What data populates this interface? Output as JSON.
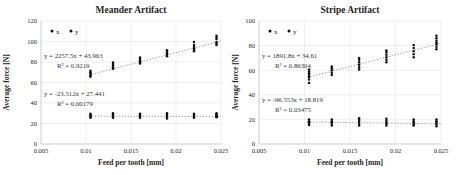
{
  "page": {
    "background": "#ffffff",
    "text_color": "#262626",
    "gridline_color": "#e3e3e3",
    "axis_color": "#bfbfbf",
    "point_color": "#111111",
    "trendline_color": "#6e6e6e"
  },
  "chart_data": [
    {
      "type": "scatter",
      "title": "Meander Artifact",
      "xlabel": "Feed per tooth [mm]",
      "ylabel": "Average force [N]",
      "xlim": [
        0.005,
        0.025
      ],
      "ylim": [
        0,
        120
      ],
      "xticks": [
        "0.005",
        "0.01",
        "0.015",
        "0.02",
        "0.025"
      ],
      "yticks": [
        0,
        20,
        40,
        60,
        80,
        100,
        120
      ],
      "grid": true,
      "legend_position": "top-left-inset",
      "legend": [
        "x",
        "y"
      ],
      "annotations": [
        {
          "equation": "y = 2257.5x + 43.963",
          "r_squared": "R² = 0.9219"
        },
        {
          "equation": "y = -23.512x + 27.441",
          "r_squared": "R² = 0.00179"
        }
      ],
      "trendlines": [
        {
          "slope": 2257.5,
          "intercept": 43.963,
          "x_range": [
            0.0103,
            0.025
          ]
        },
        {
          "slope": -23.512,
          "intercept": 27.441,
          "x_range": [
            0.0103,
            0.025
          ]
        }
      ],
      "series": [
        {
          "name": "x",
          "points": [
            [
              0.0105,
              65.5
            ],
            [
              0.0105,
              67
            ],
            [
              0.0105,
              68.5
            ],
            [
              0.0105,
              70
            ],
            [
              0.0105,
              71.5
            ],
            [
              0.013,
              73.5
            ],
            [
              0.013,
              75
            ],
            [
              0.013,
              76.5
            ],
            [
              0.013,
              78
            ],
            [
              0.013,
              79.5
            ],
            [
              0.016,
              78.5
            ],
            [
              0.016,
              80
            ],
            [
              0.016,
              81.5
            ],
            [
              0.016,
              83
            ],
            [
              0.016,
              84.5
            ],
            [
              0.019,
              85.5
            ],
            [
              0.019,
              87
            ],
            [
              0.019,
              88.5
            ],
            [
              0.019,
              90
            ],
            [
              0.019,
              91.5
            ],
            [
              0.022,
              90.5
            ],
            [
              0.022,
              92
            ],
            [
              0.022,
              93.5
            ],
            [
              0.022,
              95
            ],
            [
              0.022,
              96.5
            ],
            [
              0.022,
              99.5
            ],
            [
              0.0245,
              96.5
            ],
            [
              0.0245,
              98
            ],
            [
              0.0245,
              99.5
            ],
            [
              0.0245,
              102.5
            ],
            [
              0.0245,
              104
            ],
            [
              0.0245,
              105.5
            ]
          ]
        },
        {
          "name": "y",
          "points": [
            [
              0.0105,
              25.5
            ],
            [
              0.0105,
              26.5
            ],
            [
              0.0105,
              27.5
            ],
            [
              0.0105,
              28.5
            ],
            [
              0.0105,
              29.5
            ],
            [
              0.013,
              25.5
            ],
            [
              0.013,
              26.5
            ],
            [
              0.013,
              27.5
            ],
            [
              0.013,
              28.5
            ],
            [
              0.013,
              30
            ],
            [
              0.016,
              25.5
            ],
            [
              0.016,
              26.5
            ],
            [
              0.016,
              27.5
            ],
            [
              0.016,
              28.5
            ],
            [
              0.016,
              29.5
            ],
            [
              0.019,
              25
            ],
            [
              0.019,
              26.5
            ],
            [
              0.019,
              27.5
            ],
            [
              0.019,
              28.5
            ],
            [
              0.019,
              30
            ],
            [
              0.022,
              25.5
            ],
            [
              0.022,
              26.5
            ],
            [
              0.022,
              27.5
            ],
            [
              0.022,
              28.5
            ],
            [
              0.022,
              29.5
            ],
            [
              0.0245,
              26
            ],
            [
              0.0245,
              27
            ],
            [
              0.0245,
              28
            ],
            [
              0.0245,
              29
            ],
            [
              0.0245,
              30
            ]
          ]
        }
      ]
    },
    {
      "type": "scatter",
      "title": "Stripe Artifact",
      "xlabel": "Feed per tooth [mm]",
      "ylabel": "Average force [N]",
      "xlim": [
        0.005,
        0.025
      ],
      "ylim": [
        0,
        100
      ],
      "xticks": [
        "0.005",
        "0.01",
        "0.015",
        "0.02",
        "0.025"
      ],
      "yticks": [
        0,
        20,
        40,
        60,
        80,
        100
      ],
      "grid": true,
      "legend_position": "top-left-inset",
      "legend": [
        "x",
        "y"
      ],
      "annotations": [
        {
          "equation": "y = 1891.8x + 34.61",
          "r_squared": "R² = 0.86304"
        },
        {
          "equation": "y = -96.553x + 18.819",
          "r_squared": "R² = 0.03475"
        }
      ],
      "trendlines": [
        {
          "slope": 1891.8,
          "intercept": 34.61,
          "x_range": [
            0.0103,
            0.025
          ]
        },
        {
          "slope": -96.553,
          "intercept": 18.819,
          "x_range": [
            0.0103,
            0.025
          ]
        }
      ],
      "series": [
        {
          "name": "x",
          "points": [
            [
              0.0105,
              49.5
            ],
            [
              0.0105,
              52.5
            ],
            [
              0.0105,
              54.5
            ],
            [
              0.0105,
              56
            ],
            [
              0.0105,
              57.5
            ],
            [
              0.0105,
              59
            ],
            [
              0.0105,
              60.5
            ],
            [
              0.013,
              56
            ],
            [
              0.013,
              58
            ],
            [
              0.013,
              60
            ],
            [
              0.013,
              61.5
            ],
            [
              0.013,
              63
            ],
            [
              0.016,
              60.5
            ],
            [
              0.016,
              62.5
            ],
            [
              0.016,
              64.5
            ],
            [
              0.016,
              66.5
            ],
            [
              0.016,
              68.5
            ],
            [
              0.016,
              70
            ],
            [
              0.019,
              66.5
            ],
            [
              0.019,
              68.5
            ],
            [
              0.019,
              70.5
            ],
            [
              0.019,
              72.5
            ],
            [
              0.019,
              74.5
            ],
            [
              0.019,
              76
            ],
            [
              0.022,
              70.5
            ],
            [
              0.022,
              73
            ],
            [
              0.022,
              75.5
            ],
            [
              0.022,
              78
            ],
            [
              0.022,
              80.5
            ],
            [
              0.0245,
              77
            ],
            [
              0.0245,
              79
            ],
            [
              0.0245,
              81
            ],
            [
              0.0245,
              82.5
            ],
            [
              0.0245,
              84
            ],
            [
              0.0245,
              86
            ],
            [
              0.0245,
              88
            ]
          ]
        },
        {
          "name": "y",
          "points": [
            [
              0.0105,
              15.5
            ],
            [
              0.0105,
              16.5
            ],
            [
              0.0105,
              17.5
            ],
            [
              0.0105,
              18.5
            ],
            [
              0.0105,
              20
            ],
            [
              0.013,
              15
            ],
            [
              0.013,
              16.5
            ],
            [
              0.013,
              17.5
            ],
            [
              0.013,
              18.5
            ],
            [
              0.013,
              20
            ],
            [
              0.016,
              15
            ],
            [
              0.016,
              16.5
            ],
            [
              0.016,
              18
            ],
            [
              0.016,
              19.5
            ],
            [
              0.016,
              21
            ],
            [
              0.019,
              15
            ],
            [
              0.019,
              16.5
            ],
            [
              0.019,
              17.5
            ],
            [
              0.019,
              19
            ],
            [
              0.019,
              20.5
            ],
            [
              0.022,
              15
            ],
            [
              0.022,
              16
            ],
            [
              0.022,
              17.5
            ],
            [
              0.022,
              18.5
            ],
            [
              0.022,
              20
            ],
            [
              0.0245,
              14.5
            ],
            [
              0.0245,
              16
            ],
            [
              0.0245,
              17.5
            ],
            [
              0.0245,
              18.5
            ],
            [
              0.0245,
              20
            ]
          ]
        }
      ]
    }
  ]
}
